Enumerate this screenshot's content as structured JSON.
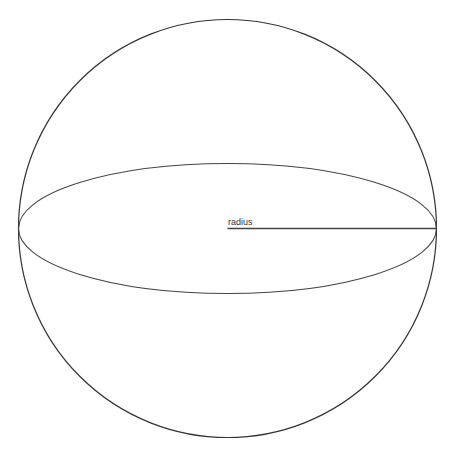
{
  "diagram": {
    "labels": {
      "radius": "radius"
    },
    "colors": {
      "stroke": "#333333",
      "background": "#ffffff"
    },
    "geometry": {
      "center": [
        227.5,
        228.5
      ],
      "sphere_radius": 209,
      "equator_ry": 65
    }
  }
}
